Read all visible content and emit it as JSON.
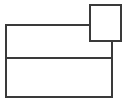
{
  "canvas": {
    "width": 136,
    "height": 106,
    "background_color": "#ffffff",
    "title": "line-drawing"
  },
  "style": {
    "stroke_color": "#3a3a3a",
    "stroke_width": 1.6,
    "fill_color": "#ffffff"
  },
  "diagram": {
    "type": "line-drawing",
    "shapes": [
      {
        "name": "large-rectangle",
        "kind": "rectangle",
        "x": 6,
        "y": 25,
        "width": 106,
        "height": 72
      },
      {
        "name": "small-square",
        "kind": "rectangle",
        "x": 90,
        "y": 5,
        "width": 31,
        "height": 36
      },
      {
        "name": "horizontal-divider",
        "kind": "line",
        "x1": 6,
        "y1": 58,
        "x2": 112,
        "y2": 58
      }
    ],
    "cells": [
      {
        "name": "upper-cell",
        "x": 6,
        "y": 25,
        "width": 106,
        "height": 33
      },
      {
        "name": "lower-cell",
        "x": 6,
        "y": 58,
        "width": 106,
        "height": 39
      }
    ],
    "paths": {
      "combined_outline": "M 90 5 L 121 5 L 121 41 L 112 41 L 112 97 L 6 97 L 6 25 L 90 25 Z",
      "square_bottom_segment": "M 90 41 L 112 41",
      "square_left_segment": "M 90 25 L 90 41",
      "divider": "M 6 58 L 112 58"
    }
  }
}
